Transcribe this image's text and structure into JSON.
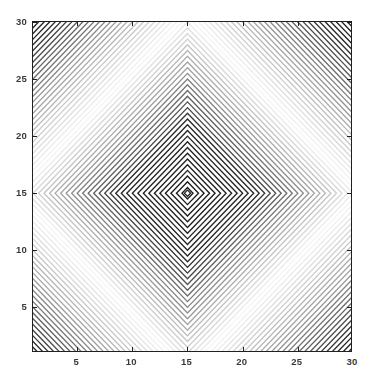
{
  "figure": {
    "kind": "contour-plot",
    "background_color": "#ffffff",
    "axes_border_color": "#202020",
    "title": "",
    "width_px": 375,
    "height_px": 383
  },
  "axes": {
    "x_ticks": [
      5,
      10,
      15,
      20,
      25,
      30
    ],
    "x_tick_labels": [
      "5",
      "10",
      "15",
      "20",
      "25",
      "30"
    ],
    "y_ticks": [
      5,
      10,
      15,
      20,
      25,
      30
    ],
    "y_tick_labels": [
      "5",
      "10",
      "15",
      "20",
      "25",
      "30"
    ],
    "xlabel": "",
    "ylabel": "",
    "xlim": [
      1,
      30
    ],
    "ylim": [
      1,
      30
    ],
    "tick_direction": "in",
    "box": true
  },
  "chart_data": {
    "type": "line",
    "plot_style": "contour",
    "title": "",
    "xlabel": "",
    "ylabel": "",
    "xlim": [
      1,
      30
    ],
    "ylim": [
      1,
      30
    ],
    "grid": false,
    "legend": "none",
    "colormap": "gray",
    "center": [
      15,
      15
    ],
    "contour_shape": "diamond",
    "function": "z = cos( (|x-15| + |y-15|) * pi / 2 )",
    "n_levels": 44,
    "x_ticks": [
      5,
      10,
      15,
      20,
      25,
      30
    ],
    "y_ticks": [
      5,
      10,
      15,
      20,
      25,
      30
    ],
    "contour_levels": [
      1,
      2,
      3,
      4,
      5,
      6,
      7,
      8,
      9,
      10,
      11,
      12,
      13,
      14,
      15,
      16,
      17,
      18,
      19,
      20,
      21,
      22,
      23,
      24,
      25,
      26,
      27,
      28,
      29
    ],
    "line_color_min": "#111111",
    "line_color_max": "#f2f2f2"
  }
}
